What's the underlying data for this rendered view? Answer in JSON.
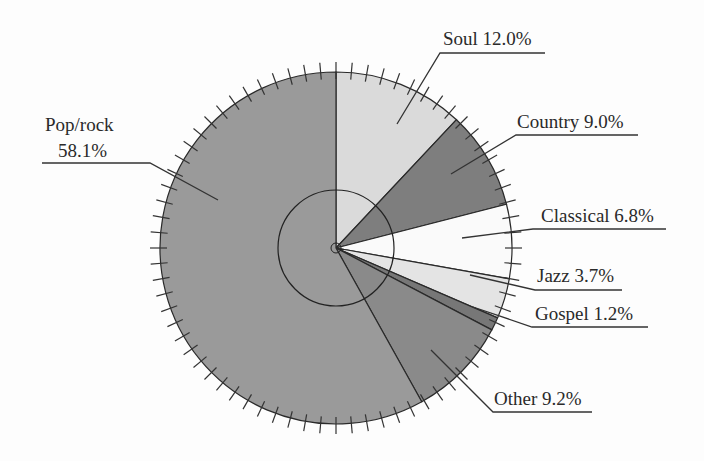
{
  "chart_data": {
    "type": "pie",
    "title": "",
    "start_angle_deg": 0,
    "direction": "clockwise",
    "center": [
      336,
      248
    ],
    "radius": 176,
    "inner_circle_radius": 58,
    "tick_count": 72,
    "slices": [
      {
        "label": "Soul",
        "value": 12.0,
        "display": "Soul 12.0%",
        "color": "#dadada"
      },
      {
        "label": "Country",
        "value": 9.0,
        "display": "Country 9.0%",
        "color": "#7e7e7e"
      },
      {
        "label": "Classical",
        "value": 6.8,
        "display": "Classical 6.8%",
        "color": "#fafafa"
      },
      {
        "label": "Jazz",
        "value": 3.7,
        "display": "Jazz 3.7%",
        "color": "#e4e4e4"
      },
      {
        "label": "Gospel",
        "value": 1.2,
        "display": "Gospel 1.2%",
        "color": "#777777"
      },
      {
        "label": "Other",
        "value": 9.2,
        "display": "Other 9.2%",
        "color": "#8a8a8a"
      },
      {
        "label": "Pop/rock",
        "value": 58.1,
        "display": "Pop/rock 58.1%",
        "color": "#9a9a9a"
      }
    ],
    "legend": "none (direct labels with leader lines)"
  },
  "labels": {
    "soul": "Soul 12.0%",
    "country": "Country 9.0%",
    "classical": "Classical 6.8%",
    "jazz": "Jazz 3.7%",
    "gospel": "Gospel 1.2%",
    "other": "Other 9.2%",
    "poprock_line1": "Pop/rock",
    "poprock_line2": "58.1%"
  }
}
